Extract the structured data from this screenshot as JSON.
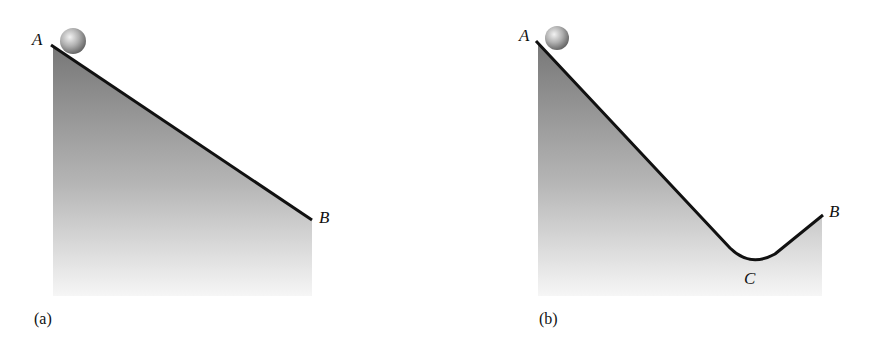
{
  "figure": {
    "panels": [
      {
        "id": "a",
        "caption": "(a)",
        "description": "Straight incline from A down to B",
        "points": {
          "A": "A",
          "B": "B"
        }
      },
      {
        "id": "b",
        "caption": "(b)",
        "description": "Incline from A down to a valley at C, then up to B",
        "points": {
          "A": "A",
          "B": "B",
          "C": "C"
        }
      }
    ],
    "colors": {
      "track": "#111111",
      "fill_top": "#7a7a7a",
      "fill_bottom": "#f4f4f4",
      "ball_light": "#e8e8e8",
      "ball_dark": "#6e6e6e"
    }
  }
}
